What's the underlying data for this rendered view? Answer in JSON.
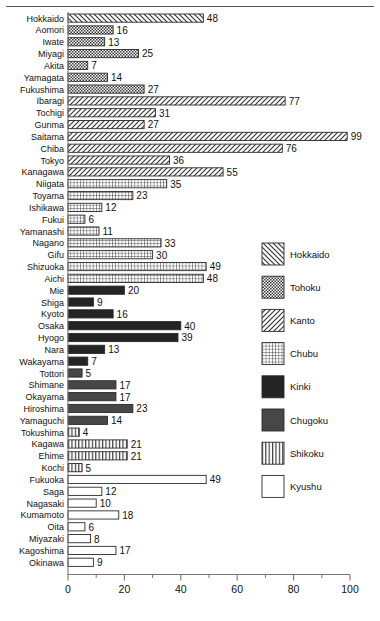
{
  "chart_data": {
    "type": "bar",
    "orientation": "horizontal",
    "title": "",
    "xlabel": "",
    "ylabel": "",
    "xlim": [
      0,
      100
    ],
    "xticks": [
      0,
      20,
      40,
      60,
      80,
      100
    ],
    "xtick_labels": [
      "0",
      "20",
      "40",
      "60",
      "80",
      "100"
    ],
    "minor_tick_step": 10,
    "grid": false,
    "legend_position": "right",
    "categories": [
      "Hokkaido",
      "Aomori",
      "Iwate",
      "Miyagi",
      "Akita",
      "Yamagata",
      "Fukushima",
      "Ibaragi",
      "Tochigi",
      "Gunma",
      "Saitama",
      "Chiba",
      "Tokyo",
      "Kanagawa",
      "Niigata",
      "Toyama",
      "Ishikawa",
      "Fukui",
      "Yamanashi",
      "Nagano",
      "Gifu",
      "Shizuoka",
      "Aichi",
      "Mie",
      "Shiga",
      "Kyoto",
      "Osaka",
      "Hyogo",
      "Nara",
      "Wakayama",
      "Tottori",
      "Shimane",
      "Okayama",
      "Hiroshima",
      "Yamaguchi",
      "Tokushima",
      "Kagawa",
      "Ehime",
      "Kochi",
      "Fukuoka",
      "Saga",
      "Nagasaki",
      "Kumamoto",
      "Oita",
      "Miyazaki",
      "Kagoshima",
      "Okinawa"
    ],
    "values": [
      48,
      16,
      13,
      25,
      7,
      14,
      27,
      77,
      31,
      27,
      99,
      76,
      36,
      55,
      35,
      23,
      12,
      6,
      11,
      33,
      30,
      49,
      48,
      20,
      9,
      16,
      40,
      39,
      13,
      7,
      5,
      17,
      17,
      23,
      14,
      4,
      21,
      21,
      5,
      49,
      12,
      10,
      18,
      6,
      8,
      17,
      9
    ],
    "groups": [
      "Hokkaido",
      "Tohoku",
      "Tohoku",
      "Tohoku",
      "Tohoku",
      "Tohoku",
      "Tohoku",
      "Kanto",
      "Kanto",
      "Kanto",
      "Kanto",
      "Kanto",
      "Kanto",
      "Kanto",
      "Chubu",
      "Chubu",
      "Chubu",
      "Chubu",
      "Chubu",
      "Chubu",
      "Chubu",
      "Chubu",
      "Chubu",
      "Kinki",
      "Kinki",
      "Kinki",
      "Kinki",
      "Kinki",
      "Kinki",
      "Kinki",
      "Chugoku",
      "Chugoku",
      "Chugoku",
      "Chugoku",
      "Chugoku",
      "Shikoku",
      "Shikoku",
      "Shikoku",
      "Shikoku",
      "Kyushu",
      "Kyushu",
      "Kyushu",
      "Kyushu",
      "Kyushu",
      "Kyushu",
      "Kyushu",
      "Kyushu"
    ],
    "legend": [
      {
        "label": "Hokkaido",
        "pattern": "diagonal-backslash"
      },
      {
        "label": "Tohoku",
        "pattern": "checkerboard"
      },
      {
        "label": "Kanto",
        "pattern": "diagonal-slash"
      },
      {
        "label": "Chubu",
        "pattern": "grid"
      },
      {
        "label": "Kinki",
        "pattern": "solid-black"
      },
      {
        "label": "Chugoku",
        "pattern": "solid-dark-gray"
      },
      {
        "label": "Shikoku",
        "pattern": "vertical-lines"
      },
      {
        "label": "Kyushu",
        "pattern": "empty-white"
      }
    ],
    "colors": {
      "kinki_fill": "#242424",
      "chugoku_fill": "#474747",
      "outline": "#2a2a2a",
      "axis": "#777777",
      "text": "#111111",
      "background": "#ffffff"
    }
  }
}
